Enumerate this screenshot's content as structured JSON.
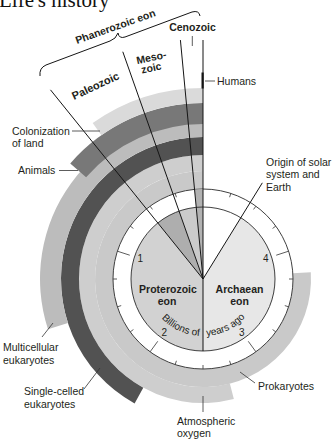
{
  "title": "Life's history",
  "diagram": {
    "type": "clock",
    "degrees_per_billion_years": 72,
    "scale": {
      "label_parts": [
        "Billions of",
        "years ago"
      ],
      "tick_interval_bya": 0.25,
      "tick_labels": [
        {
          "value": 1,
          "label": "1"
        },
        {
          "value": 2,
          "label": "2"
        },
        {
          "value": 3,
          "label": "3"
        },
        {
          "value": 4,
          "label": "4"
        }
      ]
    },
    "eons": {
      "phanerozoic": {
        "label": "Phanerozoic eon",
        "span_bya": [
          0,
          0.54
        ]
      },
      "proterozoic": {
        "label_lines": [
          "Proterozoic",
          "eon"
        ],
        "span_bya": [
          0.54,
          2.5
        ],
        "color": "#d2d2d2"
      },
      "archaean": {
        "label_lines": [
          "Archaean",
          "eon"
        ],
        "span_bya": [
          2.5,
          4.56
        ],
        "color": "#e7e7e7"
      }
    },
    "eras": [
      {
        "label_lines": [
          "Paleozoic"
        ],
        "span_bya": [
          0.27,
          0.54
        ],
        "color": "#aeaeae"
      },
      {
        "label_lines": [
          "Meso-",
          "zoic"
        ],
        "span_bya": [
          0.075,
          0.27
        ],
        "color": "#cbcbcb"
      },
      {
        "label_lines": [
          "Cenozoic"
        ],
        "span_bya": [
          0,
          0.075
        ],
        "color": "#b2b2b2"
      }
    ],
    "events": [
      {
        "label_lines": [
          "Prokaryotes"
        ],
        "start_bya": 3.8,
        "color": "#c9c9c9"
      },
      {
        "label_lines": [
          "Atmospheric",
          "oxygen"
        ],
        "start_bya": 2.7,
        "color": "#cecece"
      },
      {
        "label_lines": [
          "Single-celled",
          "eukaryotes"
        ],
        "start_bya": 2.1,
        "color": "#525252"
      },
      {
        "label_lines": [
          "Multicellular",
          "eukaryotes"
        ],
        "start_bya": 1.5,
        "color": "#bcbcbc"
      },
      {
        "label_lines": [
          "Animals"
        ],
        "start_bya": 0.68,
        "color": "#787878"
      },
      {
        "label_lines": [
          "Colonization",
          "of land"
        ],
        "start_bya": 0.49,
        "color": "#dadada"
      }
    ],
    "markers": [
      {
        "label_lines": [
          "Humans"
        ],
        "bya": 0
      },
      {
        "label_lines": [
          "Origin of solar",
          "system and",
          "Earth"
        ],
        "bya": 4.56
      }
    ]
  }
}
